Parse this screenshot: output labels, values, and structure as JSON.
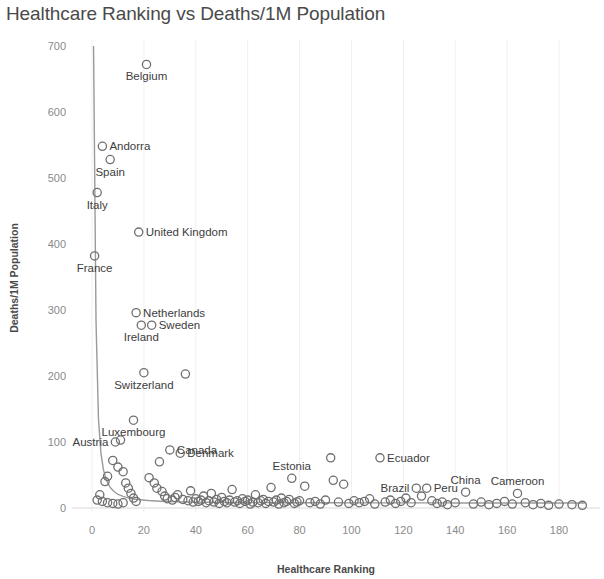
{
  "chart_data": {
    "type": "scatter",
    "title": "Healthcare Ranking vs Deaths/1M Population",
    "xlabel": "Healthcare Ranking",
    "ylabel": "Deaths/1M Population",
    "xlim": [
      -4,
      194
    ],
    "ylim": [
      -22,
      715
    ],
    "xticks": [
      0,
      20,
      40,
      60,
      80,
      100,
      120,
      140,
      160,
      180
    ],
    "yticks": [
      0,
      100,
      200,
      300,
      400,
      500,
      600,
      700
    ],
    "grid": "vertical-light",
    "legend": "none",
    "marker": "open-circle",
    "trendline": {
      "present": true,
      "shape": "power-law-decay",
      "description": "Smooth decreasing curve from high deaths at low ranking toward near zero"
    },
    "labeled_points": [
      {
        "label": "Belgium",
        "x": 21,
        "y": 672,
        "label_side": "below"
      },
      {
        "label": "Andorra",
        "x": 4,
        "y": 548,
        "label_side": "right"
      },
      {
        "label": "Spain",
        "x": 7,
        "y": 528,
        "label_side": "below"
      },
      {
        "label": "Italy",
        "x": 2,
        "y": 478,
        "label_side": "below"
      },
      {
        "label": "United Kingdom",
        "x": 18,
        "y": 418,
        "label_side": "right"
      },
      {
        "label": "France",
        "x": 1,
        "y": 382,
        "label_side": "below"
      },
      {
        "label": "Netherlands",
        "x": 17,
        "y": 296,
        "label_side": "right"
      },
      {
        "label": "Sweden",
        "x": 23,
        "y": 277,
        "label_side": "right"
      },
      {
        "label": "Ireland",
        "x": 19,
        "y": 277,
        "label_side": "below"
      },
      {
        "label": "Switzerland",
        "x": 20,
        "y": 205,
        "label_side": "below"
      },
      {
        "label": "Luxembourg",
        "x": 16,
        "y": 133,
        "label_side": "below"
      },
      {
        "label": "Canada",
        "x": 30,
        "y": 88,
        "label_side": "right"
      },
      {
        "label": "Austria",
        "x": 9,
        "y": 100,
        "label_side": "left"
      },
      {
        "label": "Denmark",
        "x": 34,
        "y": 83,
        "label_side": "right"
      },
      {
        "label": "Estonia",
        "x": 77,
        "y": 45,
        "label_side": "above"
      },
      {
        "label": "Ecuador",
        "x": 111,
        "y": 76,
        "label_side": "right"
      },
      {
        "label": "Brazil",
        "x": 125,
        "y": 30,
        "label_side": "left"
      },
      {
        "label": "Peru",
        "x": 129,
        "y": 30,
        "label_side": "right"
      },
      {
        "label": "China",
        "x": 144,
        "y": 24,
        "label_side": "above"
      },
      {
        "label": "Cameroon",
        "x": 164,
        "y": 22,
        "label_side": "above"
      }
    ],
    "points": [
      {
        "x": 1,
        "y": 382
      },
      {
        "x": 2,
        "y": 478
      },
      {
        "x": 4,
        "y": 548
      },
      {
        "x": 7,
        "y": 528
      },
      {
        "x": 21,
        "y": 672
      },
      {
        "x": 18,
        "y": 418
      },
      {
        "x": 17,
        "y": 296
      },
      {
        "x": 23,
        "y": 277
      },
      {
        "x": 19,
        "y": 277
      },
      {
        "x": 20,
        "y": 205
      },
      {
        "x": 36,
        "y": 203
      },
      {
        "x": 16,
        "y": 133
      },
      {
        "x": 11,
        "y": 103
      },
      {
        "x": 9,
        "y": 100
      },
      {
        "x": 30,
        "y": 88
      },
      {
        "x": 34,
        "y": 83
      },
      {
        "x": 26,
        "y": 70
      },
      {
        "x": 8,
        "y": 72
      },
      {
        "x": 10,
        "y": 62
      },
      {
        "x": 12,
        "y": 55
      },
      {
        "x": 6,
        "y": 48
      },
      {
        "x": 5,
        "y": 40
      },
      {
        "x": 13,
        "y": 38
      },
      {
        "x": 14,
        "y": 30
      },
      {
        "x": 3,
        "y": 20
      },
      {
        "x": 2,
        "y": 12
      },
      {
        "x": 4,
        "y": 10
      },
      {
        "x": 6,
        "y": 8
      },
      {
        "x": 8,
        "y": 7
      },
      {
        "x": 10,
        "y": 6
      },
      {
        "x": 12,
        "y": 8
      },
      {
        "x": 15,
        "y": 22
      },
      {
        "x": 16,
        "y": 15
      },
      {
        "x": 17,
        "y": 10
      },
      {
        "x": 22,
        "y": 46
      },
      {
        "x": 24,
        "y": 38
      },
      {
        "x": 25,
        "y": 30
      },
      {
        "x": 27,
        "y": 25
      },
      {
        "x": 28,
        "y": 18
      },
      {
        "x": 29,
        "y": 14
      },
      {
        "x": 31,
        "y": 12
      },
      {
        "x": 32,
        "y": 16
      },
      {
        "x": 33,
        "y": 20
      },
      {
        "x": 35,
        "y": 13
      },
      {
        "x": 37,
        "y": 11
      },
      {
        "x": 38,
        "y": 26
      },
      {
        "x": 39,
        "y": 9
      },
      {
        "x": 40,
        "y": 14
      },
      {
        "x": 41,
        "y": 10
      },
      {
        "x": 42,
        "y": 12
      },
      {
        "x": 43,
        "y": 18
      },
      {
        "x": 44,
        "y": 8
      },
      {
        "x": 45,
        "y": 11
      },
      {
        "x": 46,
        "y": 22
      },
      {
        "x": 47,
        "y": 9
      },
      {
        "x": 48,
        "y": 13
      },
      {
        "x": 49,
        "y": 7
      },
      {
        "x": 50,
        "y": 16
      },
      {
        "x": 51,
        "y": 10
      },
      {
        "x": 52,
        "y": 8
      },
      {
        "x": 53,
        "y": 12
      },
      {
        "x": 54,
        "y": 28
      },
      {
        "x": 55,
        "y": 9
      },
      {
        "x": 56,
        "y": 11
      },
      {
        "x": 57,
        "y": 7
      },
      {
        "x": 58,
        "y": 14
      },
      {
        "x": 59,
        "y": 10
      },
      {
        "x": 60,
        "y": 12
      },
      {
        "x": 61,
        "y": 6
      },
      {
        "x": 62,
        "y": 9
      },
      {
        "x": 63,
        "y": 20
      },
      {
        "x": 64,
        "y": 8
      },
      {
        "x": 65,
        "y": 11
      },
      {
        "x": 66,
        "y": 13
      },
      {
        "x": 67,
        "y": 7
      },
      {
        "x": 68,
        "y": 10
      },
      {
        "x": 69,
        "y": 31
      },
      {
        "x": 70,
        "y": 9
      },
      {
        "x": 71,
        "y": 12
      },
      {
        "x": 72,
        "y": 6
      },
      {
        "x": 73,
        "y": 15
      },
      {
        "x": 74,
        "y": 8
      },
      {
        "x": 75,
        "y": 10
      },
      {
        "x": 76,
        "y": 13
      },
      {
        "x": 77,
        "y": 45
      },
      {
        "x": 78,
        "y": 7
      },
      {
        "x": 79,
        "y": 9
      },
      {
        "x": 80,
        "y": 11
      },
      {
        "x": 82,
        "y": 33
      },
      {
        "x": 84,
        "y": 8
      },
      {
        "x": 86,
        "y": 10
      },
      {
        "x": 88,
        "y": 6
      },
      {
        "x": 90,
        "y": 12
      },
      {
        "x": 92,
        "y": 76
      },
      {
        "x": 93,
        "y": 42
      },
      {
        "x": 95,
        "y": 9
      },
      {
        "x": 97,
        "y": 36
      },
      {
        "x": 99,
        "y": 7
      },
      {
        "x": 101,
        "y": 11
      },
      {
        "x": 103,
        "y": 8
      },
      {
        "x": 105,
        "y": 10
      },
      {
        "x": 107,
        "y": 14
      },
      {
        "x": 109,
        "y": 6
      },
      {
        "x": 111,
        "y": 76
      },
      {
        "x": 113,
        "y": 9
      },
      {
        "x": 115,
        "y": 12
      },
      {
        "x": 117,
        "y": 7
      },
      {
        "x": 119,
        "y": 10
      },
      {
        "x": 121,
        "y": 15
      },
      {
        "x": 123,
        "y": 8
      },
      {
        "x": 125,
        "y": 30
      },
      {
        "x": 127,
        "y": 18
      },
      {
        "x": 129,
        "y": 30
      },
      {
        "x": 131,
        "y": 11
      },
      {
        "x": 133,
        "y": 7
      },
      {
        "x": 135,
        "y": 9
      },
      {
        "x": 137,
        "y": 5
      },
      {
        "x": 140,
        "y": 8
      },
      {
        "x": 144,
        "y": 24
      },
      {
        "x": 147,
        "y": 6
      },
      {
        "x": 150,
        "y": 9
      },
      {
        "x": 153,
        "y": 5
      },
      {
        "x": 156,
        "y": 7
      },
      {
        "x": 159,
        "y": 10
      },
      {
        "x": 162,
        "y": 6
      },
      {
        "x": 164,
        "y": 22
      },
      {
        "x": 167,
        "y": 8
      },
      {
        "x": 170,
        "y": 5
      },
      {
        "x": 173,
        "y": 7
      },
      {
        "x": 176,
        "y": 4
      },
      {
        "x": 180,
        "y": 6
      },
      {
        "x": 185,
        "y": 5
      },
      {
        "x": 189,
        "y": 4
      }
    ]
  }
}
